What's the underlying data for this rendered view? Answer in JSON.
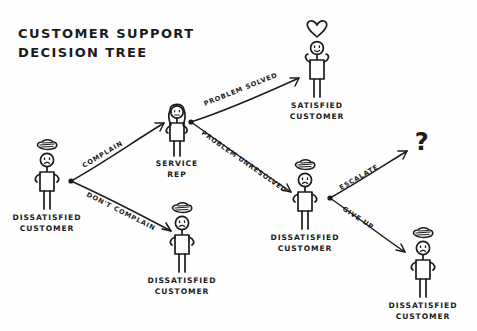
{
  "diagram": {
    "title_line1": "CUSTOMER SUPPORT",
    "title_line2": "DECISION TREE",
    "background_color": "#fefefe",
    "ink_color": "#1b1b1b",
    "style": "hand-drawn-whiteboard-sketch",
    "width": 477,
    "height": 331
  },
  "nodes": [
    {
      "id": "start-dissatisfied-customer",
      "label_line1": "DISSATISFIED",
      "label_line2": "CUSTOMER",
      "mood": "unhappy",
      "head_accessory": "storm-cloud",
      "x": 47,
      "y": 175
    },
    {
      "id": "service-rep",
      "label_line1": "SERVICE",
      "label_line2": "REP",
      "mood": "neutral",
      "head_accessory": "long-hair",
      "x": 177,
      "y": 125
    },
    {
      "id": "satisfied-customer",
      "label_line1": "SATISFIED",
      "label_line2": "CUSTOMER",
      "mood": "happy",
      "head_accessory": "heart",
      "x": 317,
      "y": 45
    },
    {
      "id": "unresolved-dissatisfied-customer",
      "label_line1": "DISSATISFIED",
      "label_line2": "CUSTOMER",
      "mood": "unhappy",
      "head_accessory": "storm-cloud",
      "x": 305,
      "y": 195
    },
    {
      "id": "no-complaint-dissatisfied-customer",
      "label_line1": "DISSATISFIED",
      "label_line2": "CUSTOMER",
      "mood": "unhappy",
      "head_accessory": "storm-cloud",
      "x": 182,
      "y": 238
    },
    {
      "id": "give-up-dissatisfied-customer",
      "label_line1": "DISSATISFIED",
      "label_line2": "CUSTOMER",
      "mood": "unhappy",
      "head_accessory": "storm-cloud",
      "x": 423,
      "y": 263
    },
    {
      "id": "escalate-unknown-outcome",
      "label_line1": "?",
      "label_line2": "",
      "mood": "unknown",
      "head_accessory": "question-mark",
      "x": 422,
      "y": 141
    }
  ],
  "edges": [
    {
      "id": "edge-complain",
      "label": "COMPLAIN",
      "from": "start-dissatisfied-customer",
      "to": "service-rep"
    },
    {
      "id": "edge-dont-complain",
      "label": "DON'T COMPLAIN",
      "from": "start-dissatisfied-customer",
      "to": "no-complaint-dissatisfied-customer"
    },
    {
      "id": "edge-problem-solved",
      "label": "PROBLEM SOLVED",
      "from": "service-rep",
      "to": "satisfied-customer"
    },
    {
      "id": "edge-problem-unresolved",
      "label": "PROBLEM UNRESOLVED",
      "from": "service-rep",
      "to": "unresolved-dissatisfied-customer"
    },
    {
      "id": "edge-escalate",
      "label": "ESCALATE",
      "from": "unresolved-dissatisfied-customer",
      "to": "escalate-unknown-outcome"
    },
    {
      "id": "edge-give-up",
      "label": "GIVE UP",
      "from": "unresolved-dissatisfied-customer",
      "to": "give-up-dissatisfied-customer"
    }
  ]
}
